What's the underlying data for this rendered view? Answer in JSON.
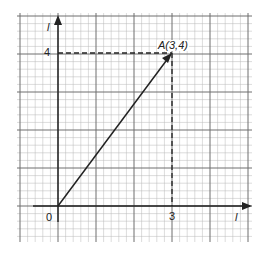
{
  "diagram": {
    "type": "graph-paper-vector",
    "axes": {
      "x_label": "l",
      "y_label": "l",
      "origin_label": "0",
      "x_tick_label": "3",
      "y_tick_label": "4"
    },
    "point": {
      "name": "A",
      "label": "A(3,4)",
      "x": 3,
      "y": 4
    },
    "colors": {
      "grid_minor": "#b8b8b8",
      "grid_major": "#6e6e6e",
      "axis": "#222222",
      "vector": "#222222"
    }
  },
  "chart_data": {
    "type": "line",
    "title": "",
    "xlabel": "l",
    "ylabel": "l",
    "series": [
      {
        "name": "vector OA",
        "x": [
          0,
          3
        ],
        "y": [
          0,
          4
        ]
      }
    ],
    "annotations": [
      "A(3,4)",
      "0",
      "3",
      "4"
    ],
    "projections": [
      {
        "from": [
          3,
          4
        ],
        "to": [
          0,
          4
        ],
        "style": "dashed"
      },
      {
        "from": [
          3,
          4
        ],
        "to": [
          3,
          0
        ],
        "style": "dashed"
      }
    ],
    "grid": true,
    "xlim": [
      -1,
      5
    ],
    "ylim": [
      -1,
      4.6
    ]
  }
}
